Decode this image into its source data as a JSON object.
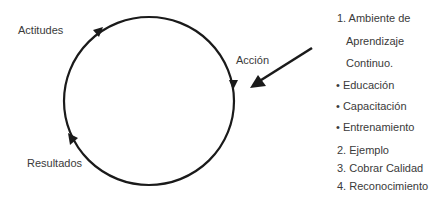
{
  "diagram": {
    "cycle_labels": {
      "top_left": "Actitudes",
      "right": "Acción",
      "bottom_left": "Resultados"
    },
    "list": [
      {
        "text": "1. Ambiente de",
        "x": 337,
        "y": 12
      },
      {
        "text": "Aprendizaje",
        "x": 346,
        "y": 35
      },
      {
        "text": "Continuo.",
        "x": 346,
        "y": 57
      },
      {
        "text": "• Educación",
        "x": 336,
        "y": 79
      },
      {
        "text": "• Capacitación",
        "x": 336,
        "y": 100
      },
      {
        "text": "• Entrenamiento",
        "x": 336,
        "y": 121
      },
      {
        "text": "2. Ejemplo",
        "x": 337,
        "y": 144
      },
      {
        "text": "3. Cobrar Calidad",
        "x": 337,
        "y": 162
      },
      {
        "text": "4.  Reconocimiento",
        "x": 337,
        "y": 180
      }
    ],
    "colors": {
      "stroke": "#1a1a1a",
      "text": "#3a3a3a"
    }
  }
}
